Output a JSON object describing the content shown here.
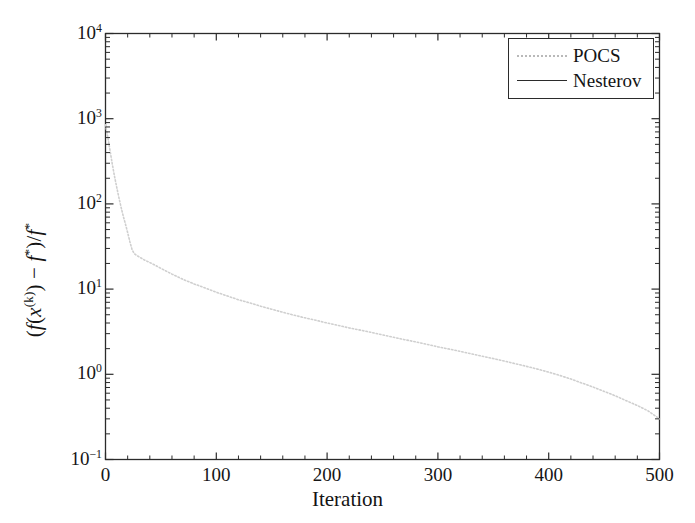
{
  "chart_data": {
    "type": "line",
    "title": "",
    "xlabel": "Iteration",
    "ylabel_text": "(f(x^(k)) - f*)/f*",
    "ylabel_parts": {
      "open": "(",
      "f1": "f",
      "lparen": "(",
      "x": "x",
      "xsup": "(k)",
      "rparen": ")",
      "minus": " − ",
      "f2": "f",
      "star1": "*",
      "close": ")/",
      "f3": "f",
      "star2": "*"
    },
    "xlim": [
      0,
      500
    ],
    "ylim": [
      0.1,
      10000
    ],
    "yscale": "log",
    "xscale": "linear",
    "grid": false,
    "xticks": [
      0,
      100,
      200,
      300,
      400,
      500
    ],
    "xtick_labels": [
      "0",
      "100",
      "200",
      "300",
      "400",
      "500"
    ],
    "yticks": [
      0.1,
      1,
      10,
      100,
      1000,
      10000
    ],
    "ytick_labels": [
      "10⁻¹",
      "10⁰",
      "10¹",
      "10²",
      "10³",
      "10⁴"
    ],
    "ytick_mantissas": [
      "10",
      "10",
      "10",
      "10",
      "10",
      "10"
    ],
    "ytick_exponents": [
      "-1",
      "0",
      "1",
      "2",
      "3",
      "4"
    ],
    "minor_ticks": true,
    "legend": {
      "position": "upper right",
      "entries": [
        {
          "label": "POCS",
          "style": "dotted",
          "color": "#c9c9c9"
        },
        {
          "label": "Nesterov",
          "style": "solid",
          "color": "#2b2b2b"
        }
      ]
    },
    "series": [
      {
        "name": "POCS",
        "style": "dotted",
        "color": "#cfcfcf",
        "x": [
          0,
          2,
          4,
          6,
          8,
          10,
          12,
          14,
          16,
          18,
          20,
          22,
          24,
          26,
          30,
          35,
          40,
          45,
          50,
          60,
          70,
          80,
          90,
          100,
          110,
          120,
          130,
          140,
          150,
          160,
          170,
          180,
          190,
          200,
          210,
          220,
          230,
          240,
          250,
          260,
          270,
          280,
          290,
          300,
          310,
          320,
          330,
          340,
          350,
          360,
          370,
          380,
          390,
          400,
          410,
          420,
          430,
          440,
          450,
          460,
          470,
          480,
          490,
          500
        ],
        "y": [
          850,
          620,
          430,
          300,
          215,
          160,
          120,
          92,
          72,
          58,
          46,
          36,
          29,
          26,
          24,
          22,
          20.5,
          19,
          17.5,
          15,
          13,
          11.5,
          10.3,
          9.2,
          8.3,
          7.5,
          6.9,
          6.3,
          5.8,
          5.35,
          4.95,
          4.6,
          4.3,
          4.0,
          3.75,
          3.5,
          3.3,
          3.1,
          2.9,
          2.72,
          2.55,
          2.4,
          2.25,
          2.1,
          1.98,
          1.86,
          1.74,
          1.63,
          1.53,
          1.43,
          1.33,
          1.24,
          1.15,
          1.06,
          0.97,
          0.88,
          0.79,
          0.71,
          0.63,
          0.56,
          0.49,
          0.43,
          0.37,
          0.3
        ]
      },
      {
        "name": "Nesterov",
        "style": "solid",
        "color": "#2b2b2b",
        "x": [],
        "y": []
      }
    ]
  },
  "legend": {
    "entries": [
      {
        "label": "POCS"
      },
      {
        "label": "Nesterov"
      }
    ]
  },
  "axes": {
    "xlabel": "Iteration",
    "xtick_labels": [
      "0",
      "100",
      "200",
      "300",
      "400",
      "500"
    ],
    "ytick_mantissas": [
      "10",
      "10",
      "10",
      "10",
      "10",
      "10"
    ],
    "ytick_exponents": [
      "4",
      "3",
      "2",
      "1",
      "0",
      "-1"
    ]
  }
}
